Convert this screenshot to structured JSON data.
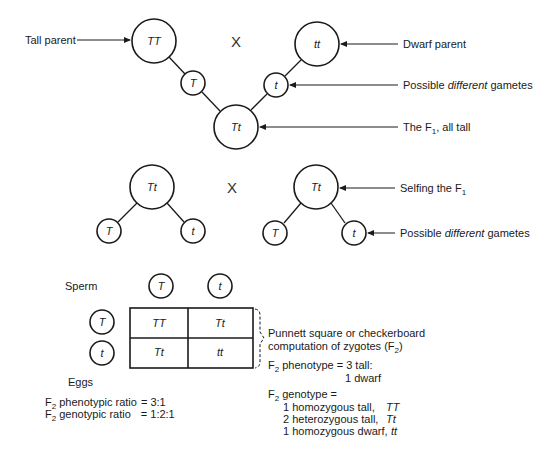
{
  "cross1": {
    "tall_parent": {
      "genotype": "TT",
      "label": "Tall parent"
    },
    "dwarf_parent": {
      "genotype": "tt",
      "label": "Dwarf parent"
    },
    "cross_symbol": "X",
    "gamete_left": "T",
    "gamete_right": "t",
    "gametes_label_prefix": "Possible ",
    "gametes_label_emph": "different",
    "gametes_label_suffix": " gametes",
    "f1": {
      "genotype": "Tt",
      "label_prefix": "The F",
      "label_sub": "1",
      "label_suffix": ", all tall"
    }
  },
  "cross2": {
    "left_parent": "Tt",
    "right_parent": "Tt",
    "cross_symbol": "X",
    "left_gametes": [
      "T",
      "t"
    ],
    "right_gametes": [
      "T",
      "t"
    ],
    "selfing_label_prefix": "Selfing the F",
    "selfing_label_sub": "1",
    "gametes_label_prefix": "Possible ",
    "gametes_label_emph": "different",
    "gametes_label_suffix": " gametes"
  },
  "punnett": {
    "sperm_label": "Sperm",
    "eggs_label": "Eggs",
    "sperm": [
      "T",
      "t"
    ],
    "eggs": [
      "T",
      "t"
    ],
    "cells": [
      [
        "TT",
        "Tt"
      ],
      [
        "Tt",
        "tt"
      ]
    ],
    "brace_label_line1": "Punnett square or checkerboard",
    "brace_label_line2_prefix": "computation of zygotes (F",
    "brace_label_line2_sub": "2",
    "brace_label_line2_suffix": ")"
  },
  "results": {
    "phenotype_prefix": "F",
    "phenotype_sub": "2",
    "phenotype_line1": " phenotype = 3 tall:",
    "phenotype_line2": "1 dwarf",
    "genotype_prefix": "F",
    "genotype_sub": "2",
    "genotype_header": " genotype =",
    "genotype_rows": [
      {
        "text": "1 homozygous tall,",
        "genotype": "TT"
      },
      {
        "text": "2 heterozygous tall,",
        "genotype": "Tt"
      },
      {
        "text": "1 homozygous dwarf,",
        "genotype": "tt"
      }
    ]
  },
  "ratios": {
    "phenotypic": {
      "prefix": "F",
      "sub": "2",
      "label": " phenotypic ratio",
      "value": "= 3:1"
    },
    "genotypic": {
      "prefix": "F",
      "sub": "2",
      "label": " genotypic ratio",
      "value": "= 1:2:1"
    }
  }
}
